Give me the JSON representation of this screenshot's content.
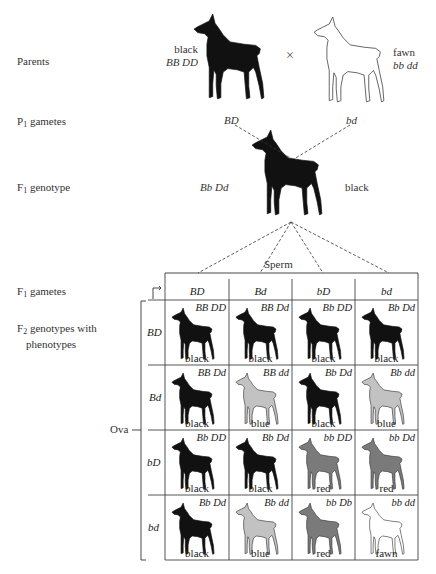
{
  "labels": {
    "parents": "Parents",
    "p1_gametes_prefix": "P",
    "p1_gametes_sub": "1",
    "p1_gametes_suffix": " gametes",
    "f1_genotype_prefix": "F",
    "f1_genotype_sub": "1",
    "f1_genotype_suffix": " genotype",
    "f1_gametes_prefix": "F",
    "f1_gametes_sub": "1",
    "f1_gametes_suffix": " gametes",
    "f2_prefix": "F",
    "f2_sub": "2",
    "f2_suffix": " genotypes with",
    "f2_line2": "phenotypes",
    "sperm": "Sperm",
    "ova": "Ova",
    "cross_symbol": "×"
  },
  "parents": {
    "left": {
      "phenotype": "black",
      "genotype": "BB DD",
      "color": "#111111"
    },
    "right": {
      "phenotype": "fawn",
      "genotype": "bb dd",
      "color": "#ffffff"
    }
  },
  "p1_gametes": {
    "left": "BD",
    "right": "bd"
  },
  "f1": {
    "genotype": "Bb Dd",
    "phenotype": "black"
  },
  "punnett": {
    "columns": [
      "BD",
      "Bd",
      "bD",
      "bd"
    ],
    "rows": [
      {
        "label": "BD",
        "cells": [
          {
            "genotype": "BB DD",
            "phenotype": "black"
          },
          {
            "genotype": "BB Dd",
            "phenotype": "black"
          },
          {
            "genotype": "Bb DD",
            "phenotype": "black"
          },
          {
            "genotype": "Bb Dd",
            "phenotype": "black"
          }
        ]
      },
      {
        "label": "Bd",
        "cells": [
          {
            "genotype": "BB Dd",
            "phenotype": "black"
          },
          {
            "genotype": "BB dd",
            "phenotype": "blue"
          },
          {
            "genotype": "Bb Dd",
            "phenotype": "black"
          },
          {
            "genotype": "Bb dd",
            "phenotype": "blue"
          }
        ]
      },
      {
        "label": "bD",
        "cells": [
          {
            "genotype": "Bb DD",
            "phenotype": "black"
          },
          {
            "genotype": "Bb Dd",
            "phenotype": "black"
          },
          {
            "genotype": "bb DD",
            "phenotype": "red"
          },
          {
            "genotype": "bb Dd",
            "phenotype": "red"
          }
        ]
      },
      {
        "label": "bd",
        "cells": [
          {
            "genotype": "Bb Dd",
            "phenotype": "black"
          },
          {
            "genotype": "Bb dd",
            "phenotype": "blue"
          },
          {
            "genotype": "bb Db",
            "phenotype": "red"
          },
          {
            "genotype": "bb dd",
            "phenotype": "fawn"
          }
        ]
      }
    ]
  },
  "phenotype_colors": {
    "black": "#111111",
    "blue": "#c2c2c2",
    "red": "#7a7a7a",
    "fawn": "#ffffff"
  }
}
